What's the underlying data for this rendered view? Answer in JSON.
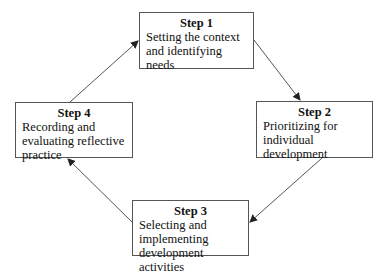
{
  "diagram": {
    "type": "cycle",
    "steps": [
      {
        "title": "Step 1",
        "text": "Setting the context and identifying needs"
      },
      {
        "title": "Step 2",
        "text": "Prioritizing for individual development"
      },
      {
        "title": "Step 3",
        "text": "Selecting and implementing development activities"
      },
      {
        "title": "Step 4",
        "text": "Recording and evaluating reflective practice"
      }
    ],
    "flow": [
      "Step 1 -> Step 2",
      "Step 2 -> Step 3",
      "Step 3 -> Step 4",
      "Step 4 -> Step 1"
    ],
    "colors": {
      "line": "#555555",
      "text": "#111111",
      "background": "#ffffff"
    }
  }
}
